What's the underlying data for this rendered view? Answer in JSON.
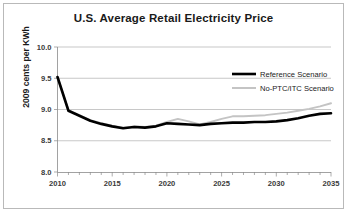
{
  "chart_data": {
    "type": "line",
    "title": "U.S. Average Retail Electricity Price",
    "xlabel": "",
    "ylabel": "2009 cents per KWh",
    "xlim": [
      2010,
      2035
    ],
    "ylim": [
      8.0,
      10.0
    ],
    "ytick_labels": [
      "10.0",
      "9.5",
      "9.0",
      "8.5",
      "8.0"
    ],
    "ytick_values": [
      10.0,
      9.5,
      9.0,
      8.5,
      8.0
    ],
    "xtick_labels": [
      "2010",
      "2015",
      "2020",
      "2025",
      "2030",
      "2035"
    ],
    "xtick_values": [
      2010,
      2015,
      2020,
      2025,
      2030,
      2035
    ],
    "minor_xticks_every": 1,
    "grid": "horizontal",
    "legend_position": "upper right",
    "x": [
      2010,
      2011,
      2012,
      2013,
      2014,
      2015,
      2016,
      2017,
      2018,
      2019,
      2020,
      2021,
      2022,
      2023,
      2024,
      2025,
      2026,
      2027,
      2028,
      2029,
      2030,
      2031,
      2032,
      2033,
      2034,
      2035
    ],
    "series": [
      {
        "name": "Reference Scenario",
        "color": "#000000",
        "width": 2.6,
        "values": [
          9.52,
          8.98,
          8.9,
          8.82,
          8.77,
          8.73,
          8.7,
          8.72,
          8.71,
          8.73,
          8.78,
          8.77,
          8.76,
          8.75,
          8.77,
          8.78,
          8.79,
          8.79,
          8.8,
          8.8,
          8.81,
          8.83,
          8.86,
          8.9,
          8.93,
          8.94
        ]
      },
      {
        "name": "No-PTC/ITC Scenario",
        "color": "#c4c4c4",
        "width": 2.0,
        "values": [
          9.52,
          8.99,
          8.91,
          8.83,
          8.78,
          8.74,
          8.71,
          8.73,
          8.72,
          8.74,
          8.8,
          8.85,
          8.81,
          8.76,
          8.8,
          8.85,
          8.89,
          8.89,
          8.9,
          8.91,
          8.93,
          8.95,
          8.98,
          9.01,
          9.05,
          9.1
        ]
      }
    ]
  }
}
